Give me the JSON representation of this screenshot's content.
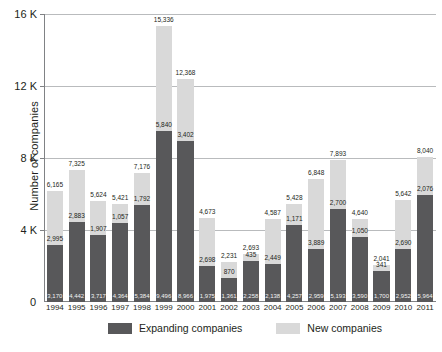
{
  "chart_data": {
    "type": "bar",
    "subtype": "stacked",
    "title": "",
    "xlabel": "",
    "ylabel": "Number of companies",
    "ylim": [
      0,
      16000
    ],
    "ytick_values": [
      0,
      4000,
      8000,
      12000,
      16000
    ],
    "ytick_labels": [
      "0",
      "4 K",
      "8 K",
      "12 K",
      "16 K"
    ],
    "grid": true,
    "grid_axis": "y",
    "legend_position": "bottom",
    "categories": [
      "1994",
      "1995",
      "1996",
      "1997",
      "1998",
      "1999",
      "2000",
      "2001",
      "2002",
      "2003",
      "2004",
      "2005",
      "2006",
      "2007",
      "2008",
      "2009",
      "2010",
      "2011"
    ],
    "series": [
      {
        "name": "Expanding companies",
        "color": "#58585a",
        "values": [
          3170,
          4442,
          3717,
          4364,
          5384,
          9496,
          8966,
          1975,
          1361,
          2258,
          2138,
          4257,
          2959,
          5193,
          3590,
          1700,
          2952,
          5964
        ]
      },
      {
        "name": "New companies",
        "color": "#d9d9d9",
        "values": [
          2995,
          2883,
          1907,
          1057,
          1792,
          5840,
          3402,
          2698,
          870,
          435,
          2449,
          1171,
          3889,
          2700,
          1050,
          341,
          2690,
          2076
        ]
      }
    ],
    "totals": [
      6165,
      7325,
      5624,
      5421,
      7176,
      15336,
      12368,
      4673,
      2231,
      2693,
      4587,
      5428,
      6848,
      7893,
      4640,
      2041,
      5642,
      8040
    ],
    "total_labels": [
      "6,165",
      "7,325",
      "5,624",
      "5,421",
      "7,176",
      "15,336",
      "12,368",
      "4,673",
      "2,231",
      "2,693",
      "4,587",
      "5,428",
      "6,848",
      "7,893",
      "4,640",
      "2,041",
      "5,642",
      "8,040"
    ],
    "series_labels": {
      "expanding": [
        "3,170",
        "4,442",
        "3,717",
        "4,364",
        "5,384",
        "9,496",
        "8,966",
        "1,975",
        "1,361",
        "2,258",
        "2,138",
        "4,257",
        "2,959",
        "5,193",
        "3,590",
        "1,700",
        "2,952",
        "5,964"
      ],
      "new": [
        "2,995",
        "2,883",
        "1,907",
        "1,057",
        "1,792",
        "5,840",
        "3,402",
        "2,698",
        "870",
        "435",
        "2,449",
        "1,171",
        "3,889",
        "2,700",
        "1,050",
        "341",
        "2,690",
        "2,076"
      ]
    },
    "legend": [
      {
        "label": "Expanding companies",
        "color": "#58585a"
      },
      {
        "label": "New companies",
        "color": "#d9d9d9"
      }
    ]
  },
  "axis": {
    "zero_label": "0"
  }
}
